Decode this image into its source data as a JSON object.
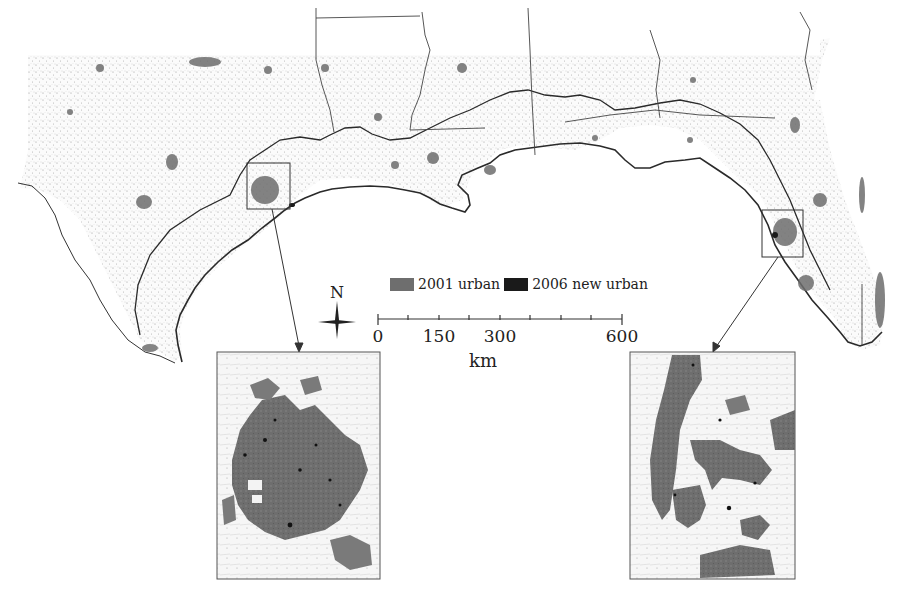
{
  "figure": {
    "type": "map",
    "region": "US Gulf of Mexico coast (Texas to Florida)",
    "colors": {
      "background": "#ffffff",
      "urban_2001": "#6e6e6e",
      "new_urban_2006": "#1a1a1a",
      "boundary": "#333333",
      "speckle": "#9a9a9a"
    }
  },
  "legend": {
    "items": [
      {
        "label": "2001 urban",
        "color": "#6e6e6e"
      },
      {
        "label": "2006 new urban",
        "color": "#1a1a1a"
      }
    ]
  },
  "north_arrow": {
    "label": "N"
  },
  "scale_bar": {
    "ticks": [
      "0",
      "150",
      "300",
      "600"
    ],
    "unit": "km"
  },
  "insets": [
    {
      "name": "houston-inset",
      "frame_on_main": [
        247,
        163,
        43,
        46
      ],
      "box": [
        217,
        352,
        163,
        227
      ]
    },
    {
      "name": "tampa-inset",
      "frame_on_main": [
        762,
        210,
        41,
        47
      ],
      "box": [
        630,
        352,
        165,
        227
      ]
    }
  ]
}
